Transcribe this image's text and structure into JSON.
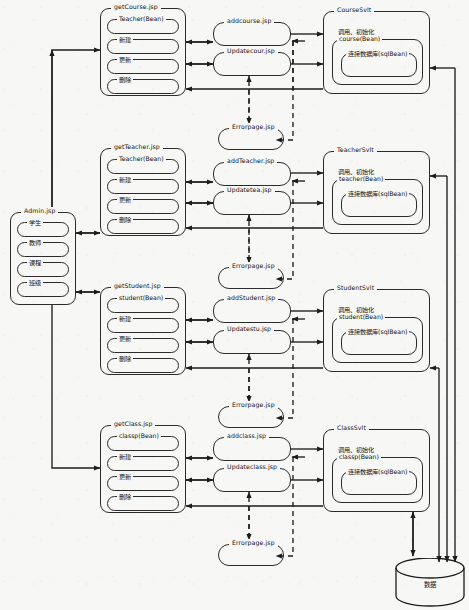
{
  "diagram": {
    "background": "#f7f7f6",
    "stroke": "#2b2b2b"
  },
  "admin": {
    "title": "Admin.jsp",
    "items": [
      {
        "label": "学生"
      },
      {
        "label": "教师"
      },
      {
        "label": "课程"
      },
      {
        "label": "班级"
      }
    ]
  },
  "rows": [
    {
      "key": "course",
      "get_page": {
        "title": "getCourse.jsp",
        "bean": "Teacher(Bean)",
        "actions": [
          {
            "label": "新建"
          },
          {
            "label": "更新"
          },
          {
            "label": "删除"
          }
        ]
      },
      "add_page": {
        "title": "addcourse.jsp"
      },
      "update_page": {
        "title": "Updatecour.jsp"
      },
      "error_page": {
        "title": "Errorpage.jsp"
      },
      "servlet": {
        "title": "CourseSvlt",
        "call_label": "调用、初始化",
        "bean": "course(Bean)",
        "db": "连接数据库(sqlBean)"
      }
    },
    {
      "key": "teacher",
      "get_page": {
        "title": "getTeacher.jsp",
        "bean": "Teacher(Bean)",
        "actions": [
          {
            "label": "新建"
          },
          {
            "label": "更新"
          },
          {
            "label": "删除"
          }
        ]
      },
      "add_page": {
        "title": "addTeacher.jsp"
      },
      "update_page": {
        "title": "Updatetea.jsp"
      },
      "error_page": {
        "title": "Errorpage.jsp"
      },
      "servlet": {
        "title": "TeacherSvlt",
        "call_label": "调用、初始化",
        "bean": "teacher(Bean)",
        "db": "连接数据库(sqlBean)"
      }
    },
    {
      "key": "student",
      "get_page": {
        "title": "getStudent.jsp",
        "bean": "student(Bean)",
        "actions": [
          {
            "label": "新建"
          },
          {
            "label": "更新"
          },
          {
            "label": "删除"
          }
        ]
      },
      "add_page": {
        "title": "addStudent.jsp"
      },
      "update_page": {
        "title": "Updatestu.jsp"
      },
      "error_page": {
        "title": "Errorpage.jsp"
      },
      "servlet": {
        "title": "StudentSvlt",
        "call_label": "调用、初始化",
        "bean": "student(Bean)",
        "db": "连接数据库(sqlBean)"
      }
    },
    {
      "key": "class",
      "get_page": {
        "title": "getClass.jsp",
        "bean": "classp(Bean)",
        "actions": [
          {
            "label": "新建"
          },
          {
            "label": "更新"
          },
          {
            "label": "删除"
          }
        ]
      },
      "add_page": {
        "title": "addclass.jsp"
      },
      "update_page": {
        "title": "Updateclass.jsp"
      },
      "error_page": {
        "title": "Errorpage.jsp"
      },
      "servlet": {
        "title": "ClassSvlt",
        "call_label": "调用、初始化",
        "bean": "classp(Bean)",
        "db": "连接数据库(sqlBean)"
      }
    }
  ],
  "database": {
    "label": "数据"
  }
}
